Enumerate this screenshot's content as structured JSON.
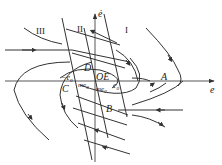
{
  "diagram": {
    "type": "phase-plane",
    "axes": {
      "x_label": "e",
      "y_label": "ė"
    },
    "regions": [
      {
        "id": "region-1",
        "label": "I"
      },
      {
        "id": "region-2",
        "label": "II"
      },
      {
        "id": "region-3",
        "label": "III"
      }
    ],
    "points": [
      {
        "id": "point-A",
        "label": "A"
      },
      {
        "id": "point-B",
        "label": "B"
      },
      {
        "id": "point-C",
        "label": "C"
      },
      {
        "id": "point-D",
        "label": "D"
      },
      {
        "id": "point-OE",
        "label": "OE"
      }
    ],
    "annotations": {
      "neg_e0": "−e",
      "neg_e0_sub": "0",
      "e0": "e",
      "e0_sub": "0",
      "me0_left": "me",
      "me0_left_sub": "0",
      "me0_right": "me",
      "me0_right_sub": "0"
    },
    "stroke_color": "#333333",
    "background": "#ffffff"
  }
}
